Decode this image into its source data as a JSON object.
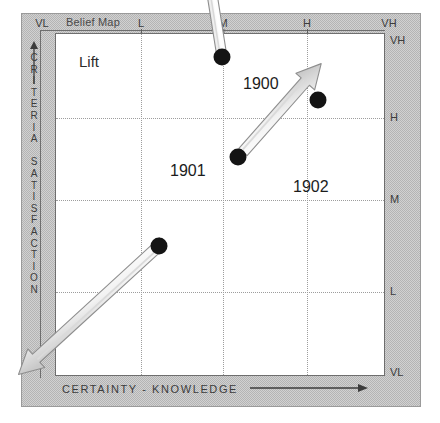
{
  "figure": {
    "title": "Belief Map",
    "annotation": "Lift"
  },
  "axes": {
    "x_title": "CERTAINTY - KNOWLEDGE",
    "x_arrow_icon": "right-arrow-icon",
    "y_title": "CRITERIA SATISFACTION",
    "y_arrow_icon": "up-arrow-icon",
    "x_ticks": [
      "VL",
      "L",
      "M",
      "H",
      "VH"
    ],
    "y_ticks": [
      "VH",
      "H",
      "M",
      "L",
      "VL"
    ]
  },
  "chart_data": {
    "type": "scatter",
    "title": "Belief Map",
    "xlabel": "CERTAINTY - KNOWLEDGE",
    "ylabel": "CRITERIA SATISFACTION",
    "xticklabels": [
      "VL",
      "L",
      "M",
      "H",
      "VH"
    ],
    "yticklabels": [
      "VL",
      "L",
      "M",
      "H",
      "VH"
    ],
    "xlim": [
      "VL",
      "VH"
    ],
    "ylim": [
      "VL",
      "VH"
    ],
    "grid": true,
    "legend": "none",
    "annotations": [
      {
        "text": "Lift",
        "x": "L",
        "y": "VH"
      },
      {
        "text": "1900",
        "x": "M-H",
        "y": "H-VH"
      },
      {
        "text": "1901",
        "x": "L-M",
        "y": "M-H"
      },
      {
        "text": "1902",
        "x": "H",
        "y": "M-H"
      }
    ],
    "points": [
      {
        "id": "p0",
        "x": "M",
        "y": "VH",
        "px": 222,
        "py": 57
      },
      {
        "id": "p1",
        "x": "M",
        "y": "H",
        "px": 238,
        "py": 157
      },
      {
        "id": "p2",
        "x": "H",
        "y": "H",
        "px": 318,
        "py": 100
      },
      {
        "id": "p3",
        "x": "L-M",
        "y": "M",
        "px": 159,
        "py": 246
      }
    ],
    "transitions": [
      {
        "label": "1900",
        "from": "p0",
        "to": "p1",
        "direction": "down"
      },
      {
        "label": "1901",
        "from": "p1",
        "to": "p3",
        "direction": "down-left"
      },
      {
        "label": "1902",
        "from": "p3",
        "to": "p2",
        "direction": "up-right"
      }
    ]
  }
}
